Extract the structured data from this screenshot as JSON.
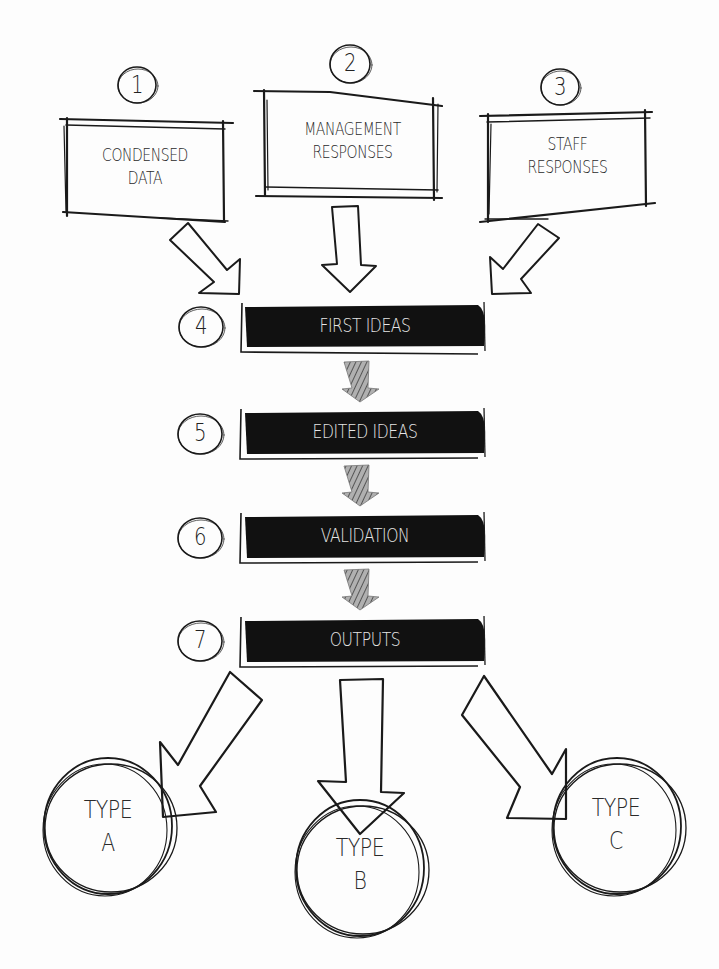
{
  "diagram": {
    "type": "flowchart",
    "style": "hand-drawn sketch",
    "colors": {
      "background": "#fdfdfd",
      "ink": "#1a1a1a",
      "bar_fill": "#111111",
      "bar_text": "#e6e6e6",
      "connector_arrow_fill": "#8a8a8a"
    },
    "inputs": [
      {
        "step": "1",
        "line1": "CONDENSED",
        "line2": "DATA"
      },
      {
        "step": "2",
        "line1": "MANAGEMENT",
        "line2": "RESPONSES"
      },
      {
        "step": "3",
        "line1": "STAFF",
        "line2": "RESPONSES"
      }
    ],
    "stages": [
      {
        "step": "4",
        "label": "FIRST IDEAS"
      },
      {
        "step": "5",
        "label": "EDITED IDEAS"
      },
      {
        "step": "6",
        "label": "VALIDATION"
      },
      {
        "step": "7",
        "label": "OUTPUTS"
      }
    ],
    "outputs": [
      {
        "line1": "TYPE",
        "line2": "A"
      },
      {
        "line1": "TYPE",
        "line2": "B"
      },
      {
        "line1": "TYPE",
        "line2": "C"
      }
    ],
    "edges": [
      {
        "from": "1",
        "to": "4",
        "style": "outline-arrow"
      },
      {
        "from": "2",
        "to": "4",
        "style": "outline-arrow"
      },
      {
        "from": "3",
        "to": "4",
        "style": "outline-arrow"
      },
      {
        "from": "4",
        "to": "5",
        "style": "hatched-arrow"
      },
      {
        "from": "5",
        "to": "6",
        "style": "hatched-arrow"
      },
      {
        "from": "6",
        "to": "7",
        "style": "hatched-arrow"
      },
      {
        "from": "7",
        "to": "TYPE A",
        "style": "outline-arrow"
      },
      {
        "from": "7",
        "to": "TYPE B",
        "style": "outline-arrow"
      },
      {
        "from": "7",
        "to": "TYPE C",
        "style": "outline-arrow"
      }
    ]
  }
}
